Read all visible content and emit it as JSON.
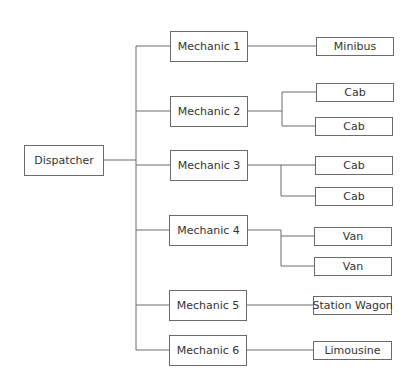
{
  "diagram": {
    "type": "org-chart",
    "root": {
      "label": "Dispatcher"
    },
    "mechanics": [
      {
        "label": "Mechanic 1",
        "vehicles": [
          "Minibus"
        ]
      },
      {
        "label": "Mechanic 2",
        "vehicles": [
          "Cab",
          "Cab"
        ]
      },
      {
        "label": "Mechanic 3",
        "vehicles": [
          "Cab",
          "Cab"
        ]
      },
      {
        "label": "Mechanic 4",
        "vehicles": [
          "Van",
          "Van"
        ]
      },
      {
        "label": "Mechanic 5",
        "vehicles": [
          "Station Wagon"
        ]
      },
      {
        "label": "Mechanic 6",
        "vehicles": [
          "Limousine"
        ]
      }
    ],
    "colors": {
      "line": "#6a6a6a",
      "text": "#333333",
      "background": "#ffffff"
    }
  }
}
